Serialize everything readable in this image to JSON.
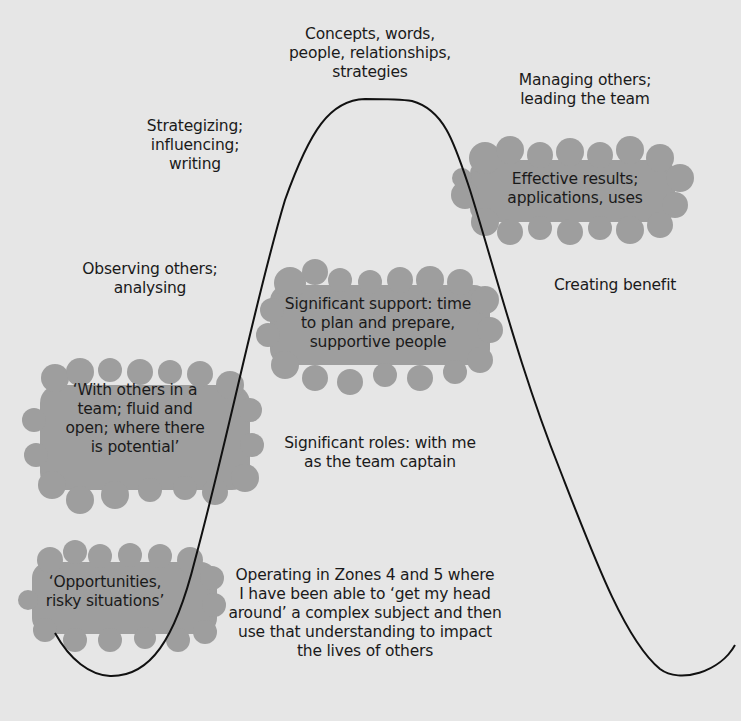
{
  "diagram": {
    "type": "bell-curve-with-annotations",
    "colors": {
      "background": "#e6e6e6",
      "cloud_fill": "#9e9e9e",
      "curve_stroke": "#111111",
      "text": "#1a1a1a"
    },
    "labels": {
      "peak": [
        "Concepts, words,",
        "people, relationships,",
        "strategies"
      ],
      "strategizing": [
        "Strategizing;",
        "influencing;",
        "writing"
      ],
      "managing": [
        "Managing others;",
        "leading the team"
      ],
      "effective_results": [
        "Effective results;",
        "applications, uses"
      ],
      "observing": [
        "Observing others;",
        "analysing"
      ],
      "significant_support": [
        "Significant support: time",
        "to plan and prepare,",
        "supportive people"
      ],
      "creating_benefit": [
        "Creating benefit"
      ],
      "with_others": [
        "‘With others in a",
        "team; fluid and",
        "open; where there",
        "is potential’"
      ],
      "significant_roles": [
        "Significant roles: with me",
        "as the team captain"
      ],
      "opportunities": [
        "‘Opportunities,",
        "risky situations’"
      ],
      "operating": [
        "Operating in Zones 4 and 5 where",
        "I have been able to ‘get my head",
        "around’ a complex subject and then",
        "use that understanding to impact",
        "the lives of others"
      ]
    },
    "clouds": [
      {
        "name": "effective-results-cloud",
        "label": "effective_results"
      },
      {
        "name": "significant-support-cloud",
        "label": "significant_support"
      },
      {
        "name": "with-others-cloud",
        "label": "with_others"
      },
      {
        "name": "opportunities-cloud",
        "label": "opportunities"
      }
    ]
  }
}
